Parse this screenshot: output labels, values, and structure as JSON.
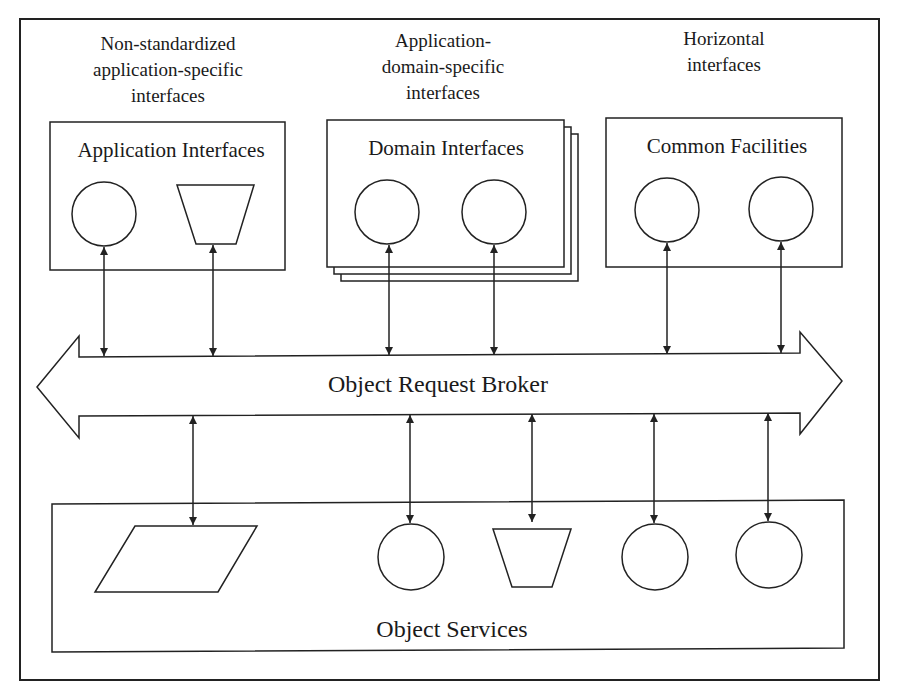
{
  "diagram": {
    "captions": {
      "app_specific": [
        "Non-standardized",
        "application-specific",
        "interfaces"
      ],
      "domain_specific": [
        "Application-",
        "domain-specific",
        "interfaces"
      ],
      "horizontal": [
        "Horizontal",
        "interfaces"
      ]
    },
    "boxes": {
      "application_interfaces": {
        "title": "Application Interfaces",
        "shapes": [
          "circle",
          "trapezoid"
        ]
      },
      "domain_interfaces": {
        "title": "Domain Interfaces",
        "shapes": [
          "circle",
          "circle"
        ],
        "stacked": true
      },
      "common_facilities": {
        "title": "Common Facilities",
        "shapes": [
          "circle",
          "circle"
        ]
      },
      "object_services": {
        "title": "Object Services",
        "shapes": [
          "parallelogram",
          "circle",
          "trapezoid",
          "circle",
          "circle"
        ]
      }
    },
    "orb": {
      "title": "Object Request Broker",
      "direction": "bidirectional"
    },
    "connections": {
      "top_to_orb": [
        "application-interfaces-circle",
        "application-interfaces-trapezoid",
        "domain-interfaces-circle-1",
        "domain-interfaces-circle-2",
        "common-facilities-circle-1",
        "common-facilities-circle-2"
      ],
      "orb_to_bottom": [
        "object-services-parallelogram",
        "object-services-circle-1",
        "object-services-trapezoid",
        "object-services-circle-2",
        "object-services-circle-3"
      ],
      "arrow_style": "double-headed"
    }
  }
}
